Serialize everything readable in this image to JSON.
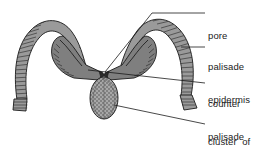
{
  "figure": {
    "background_color": "#ffffff",
    "ink_color": "#1a1a1a",
    "tissue_fill": "#8a8a8a",
    "tissue_shade_dark": "#4a4a4a",
    "width": 263,
    "height": 150
  },
  "labels": [
    {
      "id": "pore",
      "name": "pore",
      "lines": [
        "pore"
      ],
      "leader": "line from text left edge angling down-left to central pore junction"
    },
    {
      "id": "palisade-epidermis",
      "name": "palisade epidermis",
      "lines": [
        "palisade",
        "epidermis"
      ],
      "leader": "short horizontal dash to outer edge of right arch"
    },
    {
      "id": "counter-palisade",
      "name": "counter palisade",
      "lines": [
        "counter",
        "palisade"
      ],
      "leader": "near-horizontal line to inner hook of left structure"
    },
    {
      "id": "cluster-of-tracheids",
      "name": "cluster of tracheids",
      "lines": [
        "cluster  of",
        "tracheids"
      ],
      "leader": "line angling up-left to base of stippled oval"
    }
  ],
  "structures": [
    {
      "id": "left-arch",
      "name": "left palisade epidermis arch",
      "texture": "transverse cell hatching"
    },
    {
      "id": "right-arch",
      "name": "right palisade epidermis arch",
      "texture": "transverse cell hatching"
    },
    {
      "id": "left-hook",
      "name": "left counter palisade hook",
      "texture": "transverse cell hatching"
    },
    {
      "id": "right-hook",
      "name": "right counter palisade hook",
      "texture": "transverse cell hatching"
    },
    {
      "id": "pore-junction",
      "name": "central pore opening",
      "texture": "open gap"
    },
    {
      "id": "tracheid-oval",
      "name": "cluster of tracheids",
      "texture": "stippled oval"
    }
  ]
}
